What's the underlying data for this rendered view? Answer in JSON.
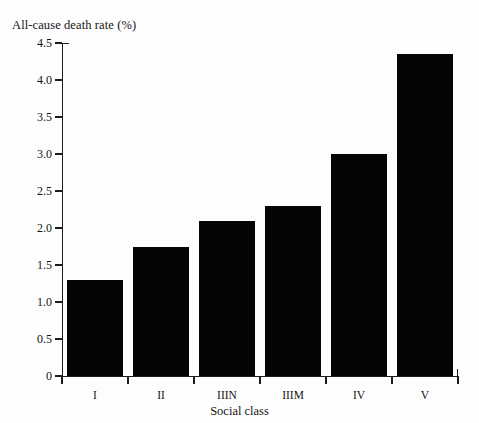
{
  "chart_data": {
    "type": "bar",
    "title": "",
    "categories": [
      "I",
      "II",
      "IIIN",
      "IIIM",
      "IV",
      "V"
    ],
    "values": [
      1.3,
      1.75,
      2.1,
      2.3,
      3.0,
      4.35
    ],
    "series": [
      {
        "name": "All-cause death rate (%)",
        "values": [
          1.3,
          1.75,
          2.1,
          2.3,
          3.0,
          4.35
        ]
      }
    ],
    "xlabel": "Social class",
    "ylabel": "All-cause death rate (%)",
    "ylim": [
      0,
      4.5
    ],
    "yticks": [
      "0",
      "0.5",
      "1.0",
      "1.5",
      "2.0",
      "2.5",
      "3.0",
      "3.5",
      "4.0",
      "4.5"
    ],
    "ytick_values": [
      0,
      0.5,
      1.0,
      1.5,
      2.0,
      2.5,
      3.0,
      3.5,
      4.0,
      4.5
    ],
    "grid": false,
    "legend": false,
    "legend_position": "none",
    "bar_color": "#050505",
    "axis_color": "#1d1d1d",
    "background": "#fdfdfd"
  }
}
